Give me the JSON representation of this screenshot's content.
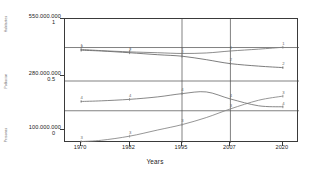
{
  "chart_data": {
    "type": "line",
    "title": "",
    "xlabel": "Years",
    "ylabel": "",
    "grid": true,
    "legend": "none",
    "xlim": [
      1966,
      2024
    ],
    "x_ticks": [
      1970,
      1982,
      1995,
      2007,
      2020
    ],
    "x_tick_labels": [
      "1970",
      "1982",
      "1995",
      "2007",
      "2020"
    ],
    "y_axes": [
      {
        "id": "axis-top",
        "value_label": "550.000.000",
        "scale_label": "1",
        "title": "Habitantes"
      },
      {
        "id": "axis-mid",
        "value_label": "280.000.000",
        "scale_label": "0.5",
        "title": "Poblacion"
      },
      {
        "id": "axis-bot",
        "value_label": "100.000.000",
        "scale_label": "0",
        "title": "Personas"
      }
    ],
    "ylim": [
      0,
      1
    ],
    "gridlines_y": [
      0.77,
      0.5,
      0.26,
      0.0
    ],
    "gridlines_x": [
      1995,
      2007
    ],
    "series": [
      {
        "name": "1",
        "marker_label": "1",
        "color": "#808080",
        "x": [
          1970,
          1975,
          1982,
          1989,
          1995,
          2001,
          2007,
          2014,
          2020
        ],
        "y": [
          0.755,
          0.745,
          0.735,
          0.728,
          0.722,
          0.726,
          0.742,
          0.757,
          0.772
        ]
      },
      {
        "name": "2",
        "marker_label": "2",
        "color": "#6e6e6e",
        "x": [
          1970,
          1975,
          1982,
          1989,
          1995,
          2001,
          2007,
          2014,
          2020
        ],
        "y": [
          0.748,
          0.742,
          0.728,
          0.712,
          0.7,
          0.672,
          0.64,
          0.62,
          0.608
        ]
      },
      {
        "name": "3",
        "marker_label": "3",
        "color": "#8a8a8a",
        "x": [
          1970,
          1975,
          1982,
          1989,
          1995,
          2001,
          2007,
          2014,
          2020
        ],
        "y": [
          0.012,
          0.022,
          0.055,
          0.105,
          0.148,
          0.205,
          0.275,
          0.345,
          0.378
        ]
      },
      {
        "name": "4",
        "marker_label": "4",
        "color": "#7a7a7a",
        "x": [
          1970,
          1975,
          1982,
          1989,
          1995,
          2001,
          2007,
          2014,
          2020
        ],
        "y": [
          0.335,
          0.34,
          0.352,
          0.372,
          0.398,
          0.412,
          0.355,
          0.3,
          0.292
        ]
      }
    ]
  }
}
